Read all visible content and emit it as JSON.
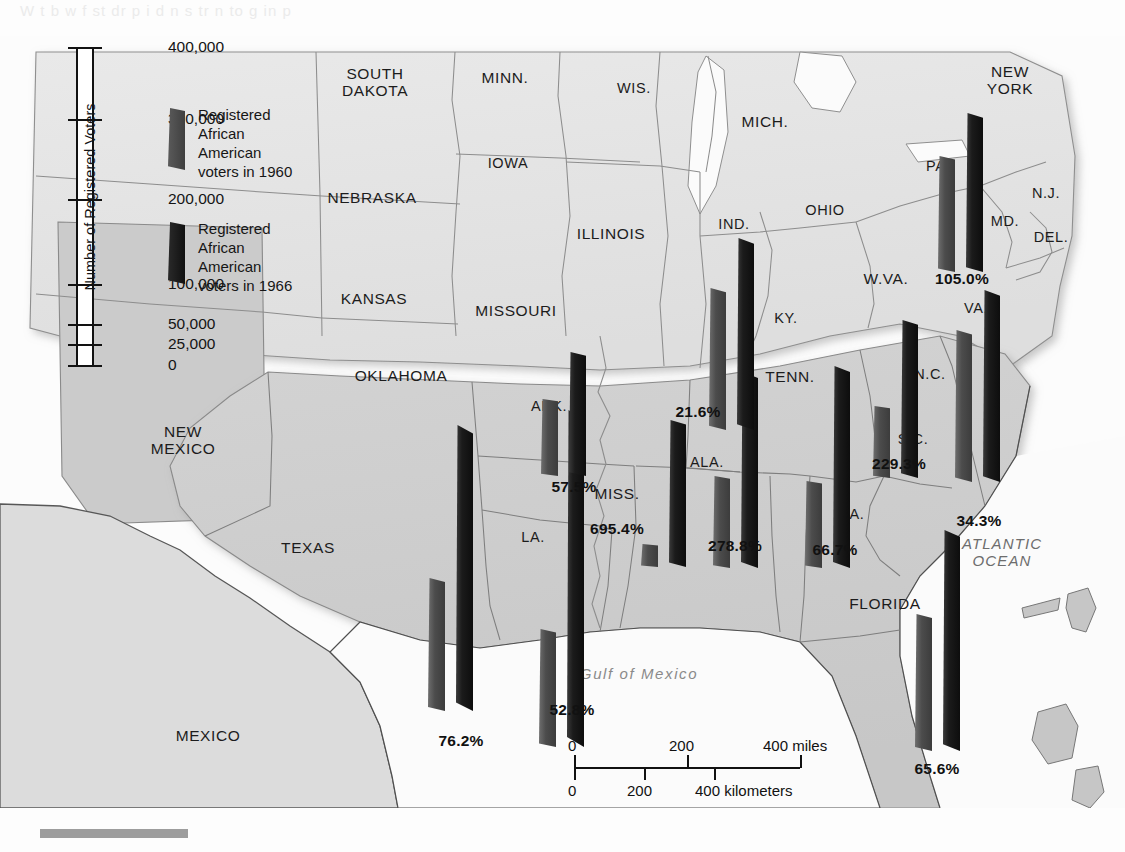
{
  "ghost_text": "W  t   b   w   f    st          dr          p  i   d      n       s    tr      n  to  g   in     p",
  "title_hidden": "",
  "axis": {
    "label": "Number of Registered Voters",
    "ticks": [
      {
        "value": "400,000",
        "pos": 0
      },
      {
        "value": "300,000",
        "pos": 72
      },
      {
        "value": "200,000",
        "pos": 152
      },
      {
        "value": "100,000",
        "pos": 237
      },
      {
        "value": "50,000",
        "pos": 277
      },
      {
        "value": "25,000",
        "pos": 297
      },
      {
        "value": "0",
        "pos": 318
      }
    ]
  },
  "legend": [
    {
      "label": "Registered\nAfrican\nAmerican\nvoters in 1960",
      "color": "#4c4c4c",
      "year": "1960"
    },
    {
      "label": "Registered\nAfrican\nAmerican\nvoters in 1966",
      "color": "#1b1b1b",
      "year": "1966"
    }
  ],
  "colors": {
    "bar_1960": "#4c4c4c",
    "bar_1966": "#1b1b1b",
    "bar_1960_edge": "#6e6e6e",
    "bar_1966_edge": "#3a3a3a",
    "land_north": "#e4e4e4",
    "land_south": "#cfcfcf",
    "land_offmap": "#cacaca",
    "water": "#fbfbfb",
    "border": "#8d8d8d",
    "coast": "#555555"
  },
  "map_labels": {
    "states": [
      {
        "name": "SOUTH\nDAKOTA",
        "x": 375,
        "y": 82
      },
      {
        "name": "MINN.",
        "x": 505,
        "y": 78
      },
      {
        "name": "WIS.",
        "x": 634,
        "y": 88
      },
      {
        "name": "MICH.",
        "x": 765,
        "y": 122
      },
      {
        "name": "NEW\nYORK",
        "x": 1010,
        "y": 80
      },
      {
        "name": "IOWA",
        "x": 508,
        "y": 163
      },
      {
        "name": "NEBRASKA",
        "x": 372,
        "y": 198
      },
      {
        "name": "ILLINOIS",
        "x": 611,
        "y": 234
      },
      {
        "name": "IND.",
        "x": 734,
        "y": 224
      },
      {
        "name": "OHIO",
        "x": 825,
        "y": 210
      },
      {
        "name": "PA.",
        "x": 938,
        "y": 166
      },
      {
        "name": "N.J.",
        "x": 1046,
        "y": 193
      },
      {
        "name": "MD.",
        "x": 1005,
        "y": 221
      },
      {
        "name": "DEL.",
        "x": 1051,
        "y": 237
      },
      {
        "name": "KANSAS",
        "x": 374,
        "y": 299
      },
      {
        "name": "MISSOURI",
        "x": 516,
        "y": 311
      },
      {
        "name": "KY.",
        "x": 786,
        "y": 318
      },
      {
        "name": "W.VA.",
        "x": 886,
        "y": 279
      },
      {
        "name": "VA.",
        "x": 976,
        "y": 308
      },
      {
        "name": "OKLAHOMA",
        "x": 401,
        "y": 376
      },
      {
        "name": "ARK.",
        "x": 549,
        "y": 406
      },
      {
        "name": "TENN.",
        "x": 790,
        "y": 377
      },
      {
        "name": "N.C.",
        "x": 930,
        "y": 374
      },
      {
        "name": "NEW\nMEXICO",
        "x": 183,
        "y": 440
      },
      {
        "name": "ALA.",
        "x": 707,
        "y": 462
      },
      {
        "name": "S.C.",
        "x": 913,
        "y": 439
      },
      {
        "name": "MISS.",
        "x": 617,
        "y": 494
      },
      {
        "name": "LA.",
        "x": 533,
        "y": 537
      },
      {
        "name": "GA.",
        "x": 851,
        "y": 514
      },
      {
        "name": "TEXAS",
        "x": 308,
        "y": 548
      },
      {
        "name": "FLORIDA",
        "x": 885,
        "y": 604
      },
      {
        "name": "MEXICO",
        "x": 208,
        "y": 736
      }
    ],
    "oceans": [
      {
        "name": "ATLANTIC\nOCEAN",
        "x": 1002,
        "y": 553
      },
      {
        "name": "Gulf of Mexico",
        "x": 639,
        "y": 674
      }
    ]
  },
  "chart_data": {
    "type": "bar",
    "ylabel": "Number of Registered Voters",
    "ytick_labels": [
      "0",
      "25,000",
      "50,000",
      "100,000",
      "200,000",
      "300,000",
      "400,000"
    ],
    "ylim": [
      0,
      400000
    ],
    "series": [
      {
        "name": "Registered African American voters in 1960",
        "color": "#4c4c4c"
      },
      {
        "name": "Registered African American voters in 1966",
        "color": "#1b1b1b"
      }
    ],
    "categories": [
      "TEXAS",
      "LA.",
      "ARK.",
      "MISS.",
      "ALA.",
      "TENN.",
      "GA.",
      "S.C.",
      "N.C.",
      "VA.",
      "FLORIDA"
    ],
    "percent_increase_labels": [
      "76.2%",
      "52.8%",
      "57.5%",
      "695.4%",
      "278.8%",
      "66.7%",
      "229.3%",
      "34.3%",
      "105.0%",
      "65.6%",
      "21.6%"
    ],
    "bars": [
      {
        "state": "TEXAS",
        "pct": "76.2%",
        "pct_x": 461,
        "pct_y": 741,
        "b1960": {
          "x": 428,
          "y": 578,
          "h": 133
        },
        "b1966": {
          "x": 456,
          "y": 425,
          "h": 286
        }
      },
      {
        "state": "LA.",
        "pct": "52.8%",
        "pct_x": 572,
        "pct_y": 710,
        "b1960": {
          "x": 539,
          "y": 629,
          "h": 118
        },
        "b1966": {
          "x": 567,
          "y": 410,
          "h": 337
        }
      },
      {
        "state": "ARK.",
        "pct": "57.5%",
        "pct_x": 574,
        "pct_y": 487,
        "b1960": {
          "x": 541,
          "y": 399,
          "h": 77
        },
        "b1966": {
          "x": 569,
          "y": 352,
          "h": 124
        }
      },
      {
        "state": "MISS.",
        "pct": "695.4%",
        "pct_x": 617,
        "pct_y": 529,
        "b1960": {
          "x": 641,
          "y": 544,
          "h": 23
        },
        "b1966": {
          "x": 669,
          "y": 420,
          "h": 147
        }
      },
      {
        "state": "ALA.",
        "pct": "278.8%",
        "pct_x": 735,
        "pct_y": 546,
        "b1960": {
          "x": 713,
          "y": 476,
          "h": 92
        },
        "b1966": {
          "x": 741,
          "y": 372,
          "h": 196
        }
      },
      {
        "state": "TENN.",
        "pct": "21.6%",
        "pct_x": 698,
        "pct_y": 412,
        "b1960": {
          "x": 709,
          "y": 288,
          "h": 142
        },
        "b1966": {
          "x": 737,
          "y": 238,
          "h": 192
        }
      },
      {
        "state": "GA.",
        "pct": "66.7%",
        "pct_x": 835,
        "pct_y": 550,
        "b1960": {
          "x": 805,
          "y": 481,
          "h": 87
        },
        "b1966": {
          "x": 833,
          "y": 366,
          "h": 202
        }
      },
      {
        "state": "S.C.",
        "pct": "229.3%",
        "pct_x": 899,
        "pct_y": 464,
        "b1960": {
          "x": 873,
          "y": 406,
          "h": 72
        },
        "b1966": {
          "x": 901,
          "y": 320,
          "h": 158
        }
      },
      {
        "state": "N.C.",
        "pct": "34.3%",
        "pct_x": 979,
        "pct_y": 521,
        "b1960": {
          "x": 955,
          "y": 330,
          "h": 152
        },
        "b1966": {
          "x": 983,
          "y": 290,
          "h": 192
        }
      },
      {
        "state": "VA.",
        "pct": "105.0%",
        "pct_x": 962,
        "pct_y": 279,
        "b1960": {
          "x": 938,
          "y": 156,
          "h": 116
        },
        "b1966": {
          "x": 966,
          "y": 113,
          "h": 159
        }
      },
      {
        "state": "FLORIDA",
        "pct": "65.6%",
        "pct_x": 937,
        "pct_y": 769,
        "b1960": {
          "x": 915,
          "y": 614,
          "h": 137
        },
        "b1966": {
          "x": 943,
          "y": 530,
          "h": 221
        }
      }
    ]
  },
  "scale": {
    "miles": {
      "ticks": [
        "0",
        "200",
        "400 miles"
      ],
      "unit": "miles"
    },
    "kilometers": {
      "ticks": [
        "0",
        "200",
        "400 kilometers"
      ],
      "unit": "kilometers"
    },
    "miles_top": [
      "0",
      "200",
      "400 miles"
    ],
    "km_bottom": [
      "0",
      "200",
      "400 kilometers"
    ]
  }
}
